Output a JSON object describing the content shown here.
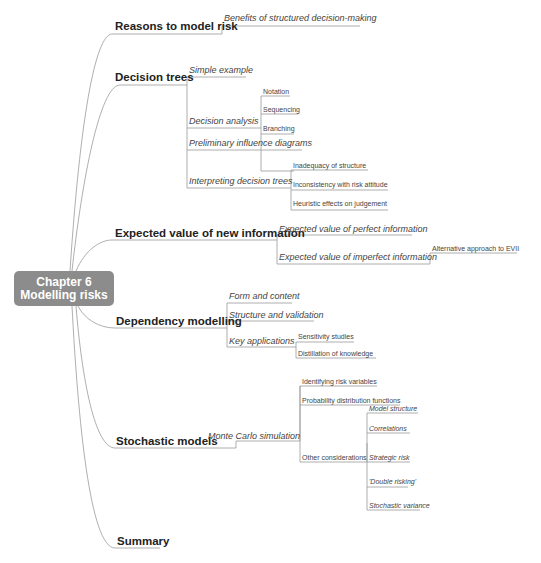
{
  "root": {
    "line1": "Chapter 6",
    "line2": "Modelling risks",
    "color": "#8c8c8c"
  },
  "branches": [
    {
      "label": "Reasons to model risk",
      "children": [
        {
          "label": "Benefits of structured decision-making"
        }
      ]
    },
    {
      "label": "Decision trees",
      "children": [
        {
          "label": "Simple example"
        },
        {
          "label": "Decision analysis",
          "children": [
            {
              "label": "Notation"
            },
            {
              "label": "Sequencing"
            },
            {
              "label": "Branching"
            }
          ]
        },
        {
          "label": "Preliminary influence diagrams"
        },
        {
          "label": "Interpreting decision trees",
          "children": [
            {
              "label": "Inadequacy of structure"
            },
            {
              "label": "Inconsistency with risk attitude"
            },
            {
              "label": "Heuristic effects on judgement"
            }
          ]
        }
      ]
    },
    {
      "label": "Expected value of new information",
      "children": [
        {
          "label": "Expected value of perfect information"
        },
        {
          "label": "Expected value of imperfect information",
          "children": [
            {
              "label": "Alternative approach to EVII"
            }
          ]
        }
      ]
    },
    {
      "label": "Dependency modelling",
      "children": [
        {
          "label": "Form and content"
        },
        {
          "label": "Structure and validation"
        },
        {
          "label": "Key applications",
          "children": [
            {
              "label": "Sensitivity studies"
            },
            {
              "label": "Distillation of knowledge"
            }
          ]
        }
      ]
    },
    {
      "label": "Stochastic models",
      "children": [
        {
          "label": "Monte Carlo simulation",
          "children": [
            {
              "label": "Identifying risk variables"
            },
            {
              "label": "Probability distribution functions"
            },
            {
              "label": "Other considerations",
              "children": [
                {
                  "label": "Model structure"
                },
                {
                  "label": "Correlations"
                },
                {
                  "label": "Strategic risk"
                },
                {
                  "label": "'Double risking'"
                },
                {
                  "label": "Stochastic variance"
                }
              ]
            }
          ]
        }
      ]
    },
    {
      "label": "Summary"
    }
  ]
}
